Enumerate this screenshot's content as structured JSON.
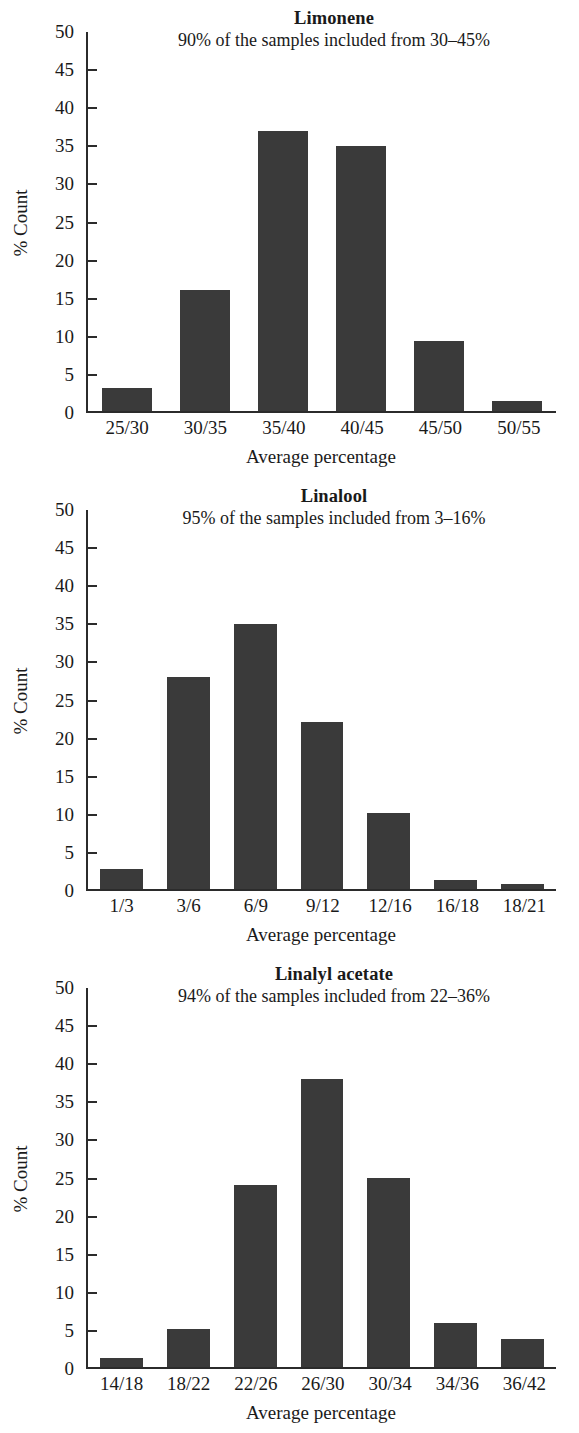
{
  "figure": {
    "panel_count": 3,
    "shared_xaxis_title": "Average percentage",
    "shared_yaxis_label": "% Count",
    "y_ticks": [
      "50",
      "45",
      "40",
      "35",
      "30",
      "25",
      "20",
      "15",
      "10",
      "5",
      "0"
    ],
    "bar_color": "#3a3a3a",
    "axis_color": "#2b2b2b",
    "background": "#ffffff"
  },
  "panels": [
    {
      "title": "Limonene",
      "subtitle": "90% of the samples included from 30–45%",
      "xaxis_title": "Average percentage",
      "yaxis_label": "% Count",
      "categories": [
        "25/30",
        "30/35",
        "35/40",
        "40/45",
        "45/50",
        "50/55"
      ],
      "values": [
        3,
        16,
        37,
        35,
        9.2,
        1.3
      ]
    },
    {
      "title": "Linalool",
      "subtitle": "95% of the samples included from 3–16%",
      "xaxis_title": "Average percentage",
      "yaxis_label": "% Count",
      "categories": [
        "1/3",
        "3/6",
        "6/9",
        "9/12",
        "12/16",
        "16/18",
        "18/21"
      ],
      "values": [
        2.7,
        28,
        35,
        22,
        10,
        1.2,
        0.6
      ]
    },
    {
      "title": "Linalyl acetate",
      "subtitle": "94% of the samples included from 22–36%",
      "xaxis_title": "Average percentage",
      "yaxis_label": "% Count",
      "categories": [
        "14/18",
        "18/22",
        "22/26",
        "26/30",
        "30/34",
        "34/36",
        "36/42"
      ],
      "values": [
        1.2,
        5,
        24,
        38,
        25,
        5.8,
        3.7
      ]
    }
  ],
  "chart_data": [
    {
      "type": "bar",
      "title": "Limonene",
      "subtitle": "90% of the samples included from 30–45%",
      "categories": [
        "25/30",
        "30/35",
        "35/40",
        "40/45",
        "45/50",
        "50/55"
      ],
      "values": [
        3,
        16,
        37,
        35,
        9.2,
        1.3
      ],
      "xlabel": "Average percentage",
      "ylabel": "% Count",
      "ylim": [
        0,
        50
      ],
      "ytick_step": 5,
      "grid": false,
      "legend": null
    },
    {
      "type": "bar",
      "title": "Linalool",
      "subtitle": "95% of the samples included from 3–16%",
      "categories": [
        "1/3",
        "3/6",
        "6/9",
        "9/12",
        "12/16",
        "16/18",
        "18/21"
      ],
      "values": [
        2.7,
        28,
        35,
        22,
        10,
        1.2,
        0.6
      ],
      "xlabel": "Average percentage",
      "ylabel": "% Count",
      "ylim": [
        0,
        50
      ],
      "ytick_step": 5,
      "grid": false,
      "legend": null
    },
    {
      "type": "bar",
      "title": "Linalyl acetate",
      "subtitle": "94% of the samples included from 22–36%",
      "categories": [
        "14/18",
        "18/22",
        "22/26",
        "26/30",
        "30/34",
        "34/36",
        "36/42"
      ],
      "values": [
        1.2,
        5,
        24,
        38,
        25,
        5.8,
        3.7
      ],
      "xlabel": "Average percentage",
      "ylabel": "% Count",
      "ylim": [
        0,
        50
      ],
      "ytick_step": 5,
      "grid": false,
      "legend": null
    }
  ]
}
